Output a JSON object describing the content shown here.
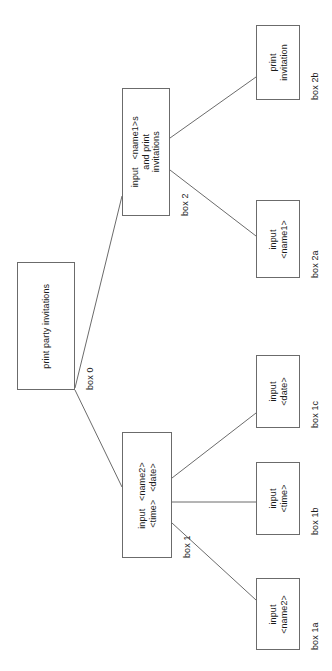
{
  "diagram": {
    "orientation": "rotated-90",
    "background_color": "#ffffff",
    "stroke_color": "#6b6b6b",
    "text_color": "#1b1b1b",
    "nodes": [
      {
        "id": "box0",
        "text": "print party invitations",
        "label": "box 0",
        "x": 17,
        "y": 262,
        "w": 58,
        "h": 128
      },
      {
        "id": "box2",
        "text": "input   <name1>s\nand print\ninvitations",
        "label": "box 2",
        "x": 122,
        "y": 88,
        "w": 48,
        "h": 128
      },
      {
        "id": "box2b",
        "text": "print\ninvitation",
        "label": "box 2b",
        "x": 256,
        "y": 25,
        "w": 44,
        "h": 75
      },
      {
        "id": "box2a",
        "text": "input\n<name1>",
        "label": "box 2a",
        "x": 256,
        "y": 200,
        "w": 44,
        "h": 78
      },
      {
        "id": "box1",
        "text": "input   <name2>\n<time>   <date>",
        "label": "box 1",
        "x": 122,
        "y": 432,
        "w": 50,
        "h": 126
      },
      {
        "id": "box1c",
        "text": "input\n<date>",
        "label": "box 1c",
        "x": 256,
        "y": 355,
        "w": 44,
        "h": 73
      },
      {
        "id": "box1b",
        "text": "input\n<time>",
        "label": "box 1b",
        "x": 256,
        "y": 462,
        "w": 44,
        "h": 73
      },
      {
        "id": "box1a",
        "text": "input\n<name2>",
        "label": "box 1a",
        "x": 256,
        "y": 578,
        "w": 44,
        "h": 72
      }
    ],
    "edges": [
      {
        "id": "edge-box0-box2",
        "from": "box0",
        "to": "box2",
        "x1": 75,
        "y1": 388,
        "x2": 122,
        "y2": 196
      },
      {
        "id": "edge-box0-box1",
        "from": "box0",
        "to": "box1",
        "x1": 75,
        "y1": 390,
        "x2": 122,
        "y2": 487
      },
      {
        "id": "edge-box2-box2b",
        "from": "box2",
        "to": "box2b",
        "x1": 170,
        "y1": 138,
        "x2": 256,
        "y2": 77
      },
      {
        "id": "edge-box2-box2a",
        "from": "box2",
        "to": "box2a",
        "x1": 170,
        "y1": 170,
        "x2": 256,
        "y2": 236
      },
      {
        "id": "edge-box1-box1c",
        "from": "box1",
        "to": "box1c",
        "x1": 172,
        "y1": 478,
        "x2": 256,
        "y2": 413
      },
      {
        "id": "edge-box1-box1b",
        "from": "box1",
        "to": "box1b",
        "x1": 172,
        "y1": 502,
        "x2": 256,
        "y2": 502
      },
      {
        "id": "edge-box1-box1a",
        "from": "box1",
        "to": "box1a",
        "x1": 172,
        "y1": 523,
        "x2": 256,
        "y2": 600
      }
    ]
  }
}
